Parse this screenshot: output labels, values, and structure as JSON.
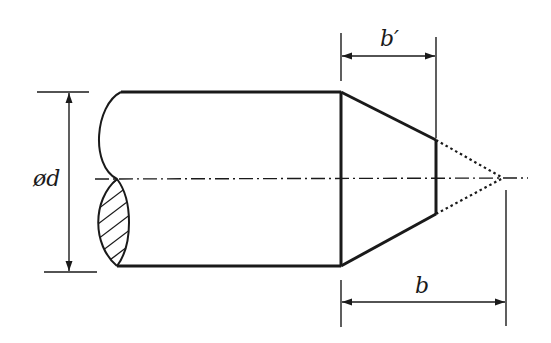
{
  "diagram": {
    "labels": {
      "diameter": "ød",
      "chamfer_length": "b′",
      "total_length": "b"
    },
    "colors": {
      "line": "#1a1a1a",
      "background": "#ffffff"
    },
    "elements": [
      "shaft-body",
      "break-line-with-hatched-section",
      "chamfer",
      "phantom-cone-tip",
      "centerline",
      "diameter-dimension",
      "chamfer-length-dimension",
      "total-length-dimension"
    ]
  }
}
